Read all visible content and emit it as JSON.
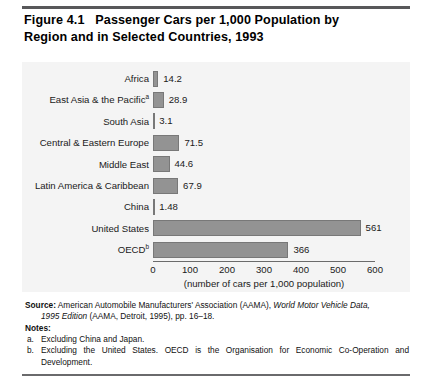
{
  "figure": {
    "title_line1": "Figure 4.1   Passenger Cars per 1,000 Population by",
    "title_line2": "Region and in Selected Countries, 1993"
  },
  "chart_data": {
    "type": "bar",
    "orientation": "horizontal",
    "title": "Figure 4.1   Passenger Cars per 1,000 Population by Region and in Selected Countries, 1993",
    "xlabel": "(number of cars per 1,000 population)",
    "ylabel": "",
    "xlim": [
      0,
      600
    ],
    "xticks": [
      "0",
      "100",
      "200",
      "300",
      "400",
      "500",
      "600"
    ],
    "grid": false,
    "legend": "none",
    "bar_color": "#939393",
    "bar_edge_color": "#787878",
    "panel_background": "#f4f4f4",
    "categories": [
      "Africa",
      "East Asia & the Pacific",
      "South Asia",
      "Central & Eastern Europe",
      "Middle East",
      "Latin America & Caribbean",
      "China",
      "United States",
      "OECD"
    ],
    "category_footnotes": [
      "",
      "a",
      "",
      "",
      "",
      "",
      "",
      "",
      "b"
    ],
    "values": [
      14.2,
      28.9,
      3.1,
      71.5,
      44.6,
      67.9,
      1.48,
      561,
      366
    ],
    "value_labels": [
      "14.2",
      "28.9",
      "3.1",
      "71.5",
      "44.6",
      "67.9",
      "1.48",
      "561",
      "366"
    ]
  },
  "notes": {
    "source_label": "Source:",
    "source_text_a": " American Automobile Manufacturers' Association (AAMA), ",
    "source_italic_a": "World Motor Vehicle Data,",
    "source_italic_b": "1995 Edition",
    "source_text_b": " (AAMA, Detroit, 1995), pp. 16–18.",
    "notes_label": "Notes:",
    "items": [
      {
        "marker": "a.",
        "text": "Excluding China and Japan."
      },
      {
        "marker": "b.",
        "text": "Excluding the United States. OECD is the Organisation for Economic Co-Operation and Development."
      }
    ]
  }
}
